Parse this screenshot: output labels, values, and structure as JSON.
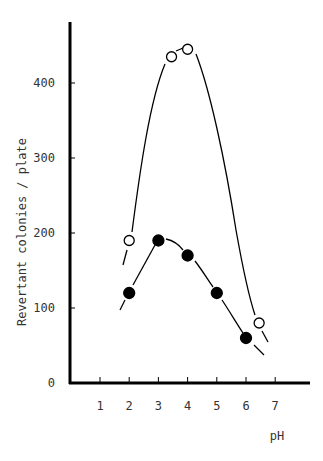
{
  "chart_data": {
    "type": "line",
    "title": "",
    "xlabel": "pH",
    "ylabel": "Revertant colonies / plate",
    "xlim": [
      0,
      8
    ],
    "ylim": [
      0,
      470
    ],
    "x_ticks": [
      "1",
      "2",
      "3",
      "4",
      "5",
      "6",
      "7"
    ],
    "y_ticks": [
      "0",
      "100",
      "200",
      "300",
      "400"
    ],
    "grid": false,
    "legend": null,
    "series": [
      {
        "name": "open circles",
        "marker": "open-circle",
        "x": [
          2.0,
          3.45,
          4.0,
          6.45
        ],
        "y": [
          190,
          435,
          445,
          80
        ]
      },
      {
        "name": "filled circles",
        "marker": "filled-circle",
        "x": [
          2.0,
          3.0,
          4.0,
          5.0,
          6.0
        ],
        "y": [
          120,
          190,
          170,
          120,
          60
        ]
      }
    ]
  }
}
